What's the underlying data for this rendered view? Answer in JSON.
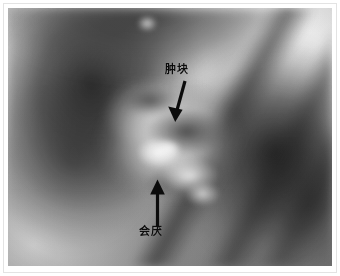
{
  "image": {
    "kind": "endoscopy-photograph",
    "modality_description": "laryngoscopic grayscale photograph",
    "alt": "Grayscale laryngoscopic photograph of the larynx with two labeled arrow annotations"
  },
  "annotations": [
    {
      "id": "mass",
      "label": "肿块",
      "arrow_icon": "arrow-down-left-icon",
      "arrow_direction": "down-left",
      "label_x": 165,
      "label_y": 64,
      "arrow_tail_x": 183,
      "arrow_tail_y": 80,
      "arrow_tip_x": 176,
      "arrow_tip_y": 122,
      "color": "#0c0c0c"
    },
    {
      "id": "epiglottis",
      "label": "会厌",
      "arrow_icon": "arrow-up-icon",
      "arrow_direction": "up",
      "label_x": 139,
      "label_y": 226,
      "arrow_tail_x": 157,
      "arrow_tail_y": 226,
      "arrow_tip_x": 157,
      "arrow_tip_y": 180,
      "color": "#0c0c0c"
    }
  ],
  "frame": {
    "border_color": "#e3e3e3",
    "background_color": "#ffffff",
    "photo_left": 8,
    "photo_top": 8,
    "photo_width": 324,
    "photo_height": 258
  }
}
